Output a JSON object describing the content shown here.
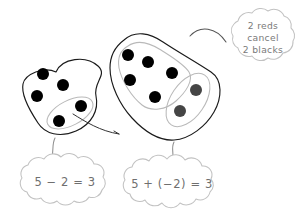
{
  "figure": {
    "background_color": "#ffffff"
  },
  "colors": {
    "black_counter": "#000000",
    "red_counter": "#454545",
    "blob_stroke": "#1a1a1a",
    "group_stroke": "#b9b9b9",
    "cloud_stroke": "#c2c2c2",
    "cloud_text": "#6f6f6f",
    "callout_text": "#7a7a7a"
  },
  "left_model": {
    "name": "subtraction-model",
    "counter_count": 5,
    "removed_count": 2,
    "counters": [
      {
        "label": "black-counter-1",
        "cx": 43,
        "cy": 74,
        "r": 6.0,
        "color": "black"
      },
      {
        "label": "black-counter-2",
        "cx": 63,
        "cy": 85,
        "r": 6.0,
        "color": "black"
      },
      {
        "label": "black-counter-3",
        "cx": 37,
        "cy": 96,
        "r": 6.0,
        "color": "black"
      },
      {
        "label": "black-counter-4",
        "cx": 81,
        "cy": 106,
        "r": 6.0,
        "color": "black"
      },
      {
        "label": "black-counter-5",
        "cx": 59,
        "cy": 121,
        "r": 6.0,
        "color": "black"
      }
    ],
    "equation": "5 − 2 = 3"
  },
  "right_model": {
    "name": "adding-negative-model",
    "black_count": 5,
    "red_count": 2,
    "black_counters": [
      {
        "label": "black-counter-1",
        "cx": 128,
        "cy": 55,
        "r": 6.0
      },
      {
        "label": "black-counter-2",
        "cx": 148,
        "cy": 62,
        "r": 6.0
      },
      {
        "label": "black-counter-3",
        "cx": 130,
        "cy": 80,
        "r": 6.0
      },
      {
        "label": "black-counter-4",
        "cx": 172,
        "cy": 73,
        "r": 6.0
      },
      {
        "label": "black-counter-5",
        "cx": 155,
        "cy": 97,
        "r": 6.0
      }
    ],
    "red_counters": [
      {
        "label": "red-counter-1",
        "cx": 196,
        "cy": 90,
        "r": 6.0
      },
      {
        "label": "red-counter-2",
        "cx": 180,
        "cy": 111,
        "r": 6.0
      }
    ],
    "equation": "5 + (−2) = 3"
  },
  "callout": {
    "name": "reds-cancel-blacks-note",
    "lines": [
      "2 reds",
      "cancel",
      "2 blacks"
    ]
  }
}
